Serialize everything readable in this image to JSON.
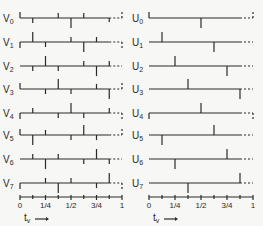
{
  "figure": {
    "left_panel": {
      "prefix": "V",
      "x0": 20,
      "x1": 122,
      "rows": [
        {
          "label": "V",
          "sub": "0",
          "y": 18,
          "start": "up",
          "end": "up",
          "ticks": [
            [
              1,
              "down",
              5
            ],
            [
              3,
              "up",
              5
            ],
            [
              4,
              "down",
              10
            ],
            [
              5,
              "up",
              5
            ],
            [
              7,
              "down",
              4
            ]
          ]
        },
        {
          "label": "V",
          "sub": "1",
          "y": 42,
          "start": "down",
          "end": "down",
          "ticks": [
            [
              1,
              "up",
              10
            ],
            [
              2,
              "down",
              5
            ],
            [
              4,
              "up",
              5
            ],
            [
              5,
              "down",
              10
            ],
            [
              6,
              "up",
              5
            ]
          ]
        },
        {
          "label": "V",
          "sub": "2",
          "y": 66,
          "start": "none",
          "end": "none",
          "ticks": [
            [
              1,
              "down",
              5
            ],
            [
              2,
              "up",
              10
            ],
            [
              3,
              "down",
              5
            ],
            [
              5,
              "up",
              5
            ],
            [
              6,
              "down",
              10
            ],
            [
              7,
              "up",
              5
            ]
          ]
        },
        {
          "label": "V",
          "sub": "3",
          "y": 89,
          "start": "up",
          "end": "up",
          "ticks": [
            [
              2,
              "down",
              5
            ],
            [
              3,
              "up",
              10
            ],
            [
              4,
              "down",
              5
            ],
            [
              6,
              "up",
              5
            ],
            [
              7,
              "down",
              10
            ]
          ]
        },
        {
          "label": "V",
          "sub": "4",
          "y": 113,
          "start": "down",
          "end": "down",
          "ticks": [
            [
              1,
              "up",
              5
            ],
            [
              3,
              "down",
              5
            ],
            [
              4,
              "up",
              10
            ],
            [
              5,
              "down",
              5
            ],
            [
              7,
              "up",
              5
            ]
          ]
        },
        {
          "label": "V",
          "sub": "5",
          "y": 135,
          "start": "up",
          "end": "up",
          "ticks": [
            [
              1,
              "down",
              10
            ],
            [
              2,
              "up",
              5
            ],
            [
              4,
              "down",
              5
            ],
            [
              5,
              "up",
              10
            ],
            [
              6,
              "down",
              5
            ]
          ]
        },
        {
          "label": "V",
          "sub": "6",
          "y": 159,
          "start": "none",
          "end": "none",
          "ticks": [
            [
              1,
              "up",
              5
            ],
            [
              2,
              "down",
              10
            ],
            [
              3,
              "up",
              5
            ],
            [
              5,
              "down",
              5
            ],
            [
              6,
              "up",
              10
            ],
            [
              7,
              "down",
              5
            ]
          ]
        },
        {
          "label": "V",
          "sub": "7",
          "y": 183,
          "start": "down",
          "end": "down",
          "ticks": [
            [
              2,
              "up",
              5
            ],
            [
              3,
              "down",
              10
            ],
            [
              4,
              "up",
              5
            ],
            [
              6,
              "down",
              5
            ],
            [
              7,
              "up",
              10
            ]
          ]
        }
      ]
    },
    "right_panel": {
      "prefix": "U",
      "x0": 149,
      "x1": 253,
      "rows": [
        {
          "label": "U",
          "sub": "0",
          "y": 18,
          "start": "up",
          "end": "up",
          "ticks": [
            [
              4,
              "down",
              10
            ]
          ]
        },
        {
          "label": "U",
          "sub": "1",
          "y": 42,
          "start": "none",
          "end": "none",
          "ticks": [
            [
              1,
              "up",
              10
            ],
            [
              5,
              "down",
              10
            ]
          ]
        },
        {
          "label": "U",
          "sub": "2",
          "y": 66,
          "start": "none",
          "end": "none",
          "ticks": [
            [
              2,
              "up",
              10
            ],
            [
              6,
              "down",
              10
            ]
          ]
        },
        {
          "label": "U",
          "sub": "3",
          "y": 89,
          "start": "none",
          "end": "none",
          "ticks": [
            [
              3,
              "up",
              10
            ],
            [
              7,
              "down",
              10
            ]
          ]
        },
        {
          "label": "U",
          "sub": "4",
          "y": 113,
          "start": "down",
          "end": "down",
          "ticks": [
            [
              4,
              "up",
              10
            ]
          ]
        },
        {
          "label": "U",
          "sub": "5",
          "y": 135,
          "start": "none",
          "end": "none",
          "ticks": [
            [
              1,
              "down",
              10
            ],
            [
              5,
              "up",
              10
            ]
          ]
        },
        {
          "label": "U",
          "sub": "6",
          "y": 159,
          "start": "none",
          "end": "none",
          "ticks": [
            [
              2,
              "down",
              10
            ],
            [
              6,
              "up",
              10
            ]
          ]
        },
        {
          "label": "U",
          "sub": "7",
          "y": 183,
          "start": "none",
          "end": "none",
          "ticks": [
            [
              3,
              "down",
              10
            ],
            [
              7,
              "up",
              10
            ]
          ]
        }
      ]
    },
    "axis": {
      "y": 197,
      "tick_labels": [
        {
          "pos": 0,
          "text": "0"
        },
        {
          "pos": 2,
          "text": "1/4"
        },
        {
          "pos": 4,
          "text": "1/2"
        },
        {
          "pos": 6,
          "text": "3/4"
        },
        {
          "pos": 8,
          "text": "1"
        }
      ],
      "variable": "t",
      "variable_sub": "v",
      "arrow": "→"
    },
    "line_color": "#2a2a2a"
  }
}
